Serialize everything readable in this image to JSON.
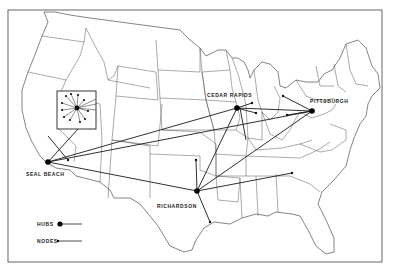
{
  "map": {
    "colors": {
      "background": "#ffffff",
      "ink": "#1a1a1a",
      "border": "#555555",
      "state_lines": "#3a3a3a"
    },
    "hubs": [
      {
        "id": "seal-beach",
        "label": "SEAL BEACH",
        "x": 48,
        "y": 162
      },
      {
        "id": "cedar-rapids",
        "label": "CEDAR RAPIDS",
        "x": 237,
        "y": 108
      },
      {
        "id": "pittsburgh",
        "label": "PITTSBURGH",
        "x": 312,
        "y": 111
      },
      {
        "id": "richardson",
        "label": "RICHARDSON",
        "x": 197,
        "y": 191
      }
    ],
    "inset": {
      "x": 57,
      "y": 91,
      "width": 39,
      "height": 38,
      "center_x": 77,
      "center_y": 108
    },
    "legend": {
      "hubs_label": "HUBS",
      "nodes_label": "NODES"
    }
  }
}
